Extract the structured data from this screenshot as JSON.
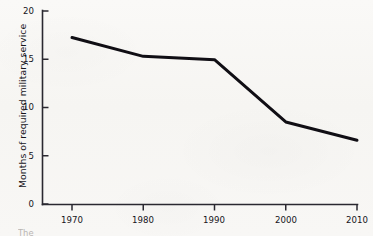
{
  "chart_data": {
    "type": "line",
    "title": "",
    "xlabel": "",
    "ylabel": "Months of required military service",
    "x": [
      1970,
      1980,
      1990,
      2000,
      2010
    ],
    "categories": [
      "1970",
      "1980",
      "1990",
      "2000",
      "2010"
    ],
    "values": [
      17.25,
      15.3,
      14.95,
      8.5,
      6.6
    ],
    "series": [
      {
        "name": "Months of required military service",
        "values": [
          17.25,
          15.3,
          14.95,
          8.5,
          6.6
        ]
      }
    ],
    "xlim": [
      1970,
      2010
    ],
    "ylim": [
      0,
      20
    ],
    "yticks": [
      0,
      5,
      10,
      15,
      20
    ],
    "ytick_labels": [
      "0",
      "5",
      "10",
      "15",
      "20"
    ],
    "xticks": [
      1970,
      1980,
      1990,
      2000,
      2010
    ],
    "xtick_labels": [
      "1970",
      "1980",
      "1990",
      "2000",
      "2010"
    ],
    "grid": false,
    "legend": false,
    "legend_position": "none",
    "line_color": "#100e14",
    "line_width": 3,
    "axis_color": "#2a2830",
    "background_color": "#f7f6f4"
  },
  "axes": {
    "y_label": "Months of required military service",
    "y_tick_labels": [
      "20",
      "15",
      "10",
      "5",
      "0"
    ],
    "x_tick_labels": [
      "1970",
      "1980",
      "1990",
      "2000",
      "2010"
    ]
  },
  "footer": {
    "partial_caption": "The"
  }
}
